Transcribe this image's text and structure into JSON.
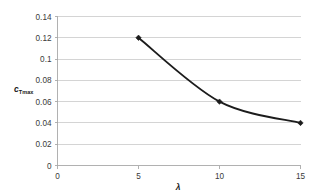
{
  "chart_data": {
    "type": "line",
    "title": "",
    "xlabel": "λ",
    "ylabel": "c_Tmax",
    "ylabel_base": "c",
    "ylabel_sub": "Tmax",
    "x": [
      5,
      10,
      15
    ],
    "values": [
      0.12,
      0.06,
      0.04
    ],
    "series": [
      {
        "name": "cTmax",
        "x": [
          5,
          10,
          15
        ],
        "values": [
          0.12,
          0.06,
          0.04
        ]
      }
    ],
    "xlim": [
      0,
      15
    ],
    "ylim": [
      0,
      0.14
    ],
    "xticks": [
      0,
      5,
      10,
      15
    ],
    "yticks": [
      0,
      0.02,
      0.04,
      0.06,
      0.08,
      0.1,
      0.12,
      0.14
    ],
    "xtick_labels": [
      "0",
      "5",
      "10",
      "15"
    ],
    "ytick_labels": [
      "0",
      "0.02",
      "0.04",
      "0.06",
      "0.08",
      "0.1",
      "0.12",
      "0.14"
    ],
    "grid": "horizontal",
    "legend": "none",
    "smoothed": true,
    "marker": "diamond",
    "colors": {
      "line": "#1c1c1c",
      "marker": "#1c1c1c",
      "grid": "#c9c9c9",
      "axis": "#a8a8a8",
      "background": "#ffffff",
      "text": "#3a3a3a"
    }
  }
}
